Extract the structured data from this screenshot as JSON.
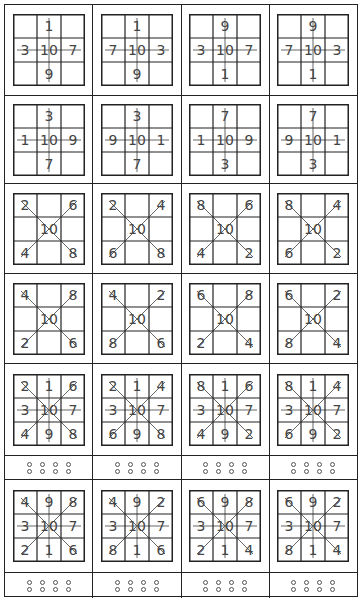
{
  "puzzle": {
    "description": "3x3 grids with center value 10 and numbers placed around it, connected by lines through the center",
    "center": "10",
    "rows": [
      {
        "type": "grid",
        "cells": [
          {
            "lines": [
              "v",
              "h"
            ],
            "g": [
              "",
              "1",
              "",
              "3",
              "10",
              "7",
              "",
              "9",
              ""
            ]
          },
          {
            "lines": [
              "v",
              "h"
            ],
            "g": [
              "",
              "1",
              "",
              "7",
              "10",
              "3",
              "",
              "9",
              ""
            ]
          },
          {
            "lines": [
              "v",
              "h"
            ],
            "g": [
              "",
              "9",
              "",
              "3",
              "10",
              "7",
              "",
              "1",
              ""
            ]
          },
          {
            "lines": [
              "v",
              "h"
            ],
            "g": [
              "",
              "9",
              "",
              "7",
              "10",
              "3",
              "",
              "1",
              ""
            ]
          }
        ]
      },
      {
        "type": "grid",
        "cells": [
          {
            "lines": [
              "v",
              "h"
            ],
            "g": [
              "",
              "3",
              "",
              "1",
              "10",
              "9",
              "",
              "7",
              ""
            ]
          },
          {
            "lines": [
              "v",
              "h"
            ],
            "g": [
              "",
              "3",
              "",
              "9",
              "10",
              "1",
              "",
              "7",
              ""
            ]
          },
          {
            "lines": [
              "v",
              "h"
            ],
            "g": [
              "",
              "7",
              "",
              "1",
              "10",
              "9",
              "",
              "3",
              ""
            ]
          },
          {
            "lines": [
              "v",
              "h"
            ],
            "g": [
              "",
              "7",
              "",
              "9",
              "10",
              "1",
              "",
              "3",
              ""
            ]
          }
        ]
      },
      {
        "type": "grid",
        "cells": [
          {
            "lines": [
              "d1",
              "d2"
            ],
            "g": [
              "2",
              "",
              "6",
              "",
              "10",
              "",
              "4",
              "",
              "8"
            ]
          },
          {
            "lines": [
              "d1",
              "d2"
            ],
            "g": [
              "2",
              "",
              "4",
              "",
              "10",
              "",
              "6",
              "",
              "8"
            ]
          },
          {
            "lines": [
              "d1",
              "d2"
            ],
            "g": [
              "8",
              "",
              "6",
              "",
              "10",
              "",
              "4",
              "",
              "2"
            ]
          },
          {
            "lines": [
              "d1",
              "d2"
            ],
            "g": [
              "8",
              "",
              "4",
              "",
              "10",
              "",
              "6",
              "",
              "2"
            ]
          }
        ]
      },
      {
        "type": "grid",
        "cells": [
          {
            "lines": [
              "d1",
              "d2"
            ],
            "g": [
              "4",
              "",
              "8",
              "",
              "10",
              "",
              "2",
              "",
              "6"
            ]
          },
          {
            "lines": [
              "d1",
              "d2"
            ],
            "g": [
              "4",
              "",
              "2",
              "",
              "10",
              "",
              "8",
              "",
              "6"
            ]
          },
          {
            "lines": [
              "d1",
              "d2"
            ],
            "g": [
              "6",
              "",
              "8",
              "",
              "10",
              "",
              "2",
              "",
              "4"
            ]
          },
          {
            "lines": [
              "d1",
              "d2"
            ],
            "g": [
              "6",
              "",
              "2",
              "",
              "10",
              "",
              "8",
              "",
              "4"
            ]
          }
        ]
      },
      {
        "type": "grid",
        "cells": [
          {
            "lines": [
              "v",
              "h",
              "d1",
              "d2"
            ],
            "g": [
              "2",
              "1",
              "6",
              "3",
              "10",
              "7",
              "4",
              "9",
              "8"
            ]
          },
          {
            "lines": [
              "v",
              "h",
              "d1",
              "d2"
            ],
            "g": [
              "2",
              "1",
              "4",
              "3",
              "10",
              "7",
              "6",
              "9",
              "8"
            ]
          },
          {
            "lines": [
              "v",
              "h",
              "d1",
              "d2"
            ],
            "g": [
              "8",
              "1",
              "6",
              "3",
              "10",
              "7",
              "4",
              "9",
              "2"
            ]
          },
          {
            "lines": [
              "v",
              "h",
              "d1",
              "d2"
            ],
            "g": [
              "8",
              "1",
              "4",
              "3",
              "10",
              "7",
              "6",
              "9",
              "2"
            ]
          }
        ]
      },
      {
        "type": "dots",
        "cells": [
          {
            "rows": 2,
            "cols": 4
          },
          {
            "rows": 2,
            "cols": 4
          },
          {
            "rows": 2,
            "cols": 4
          },
          {
            "rows": 2,
            "cols": 4
          }
        ]
      },
      {
        "type": "grid",
        "cells": [
          {
            "lines": [
              "v",
              "h",
              "d1",
              "d2"
            ],
            "g": [
              "4",
              "9",
              "8",
              "3",
              "10",
              "7",
              "2",
              "1",
              "6"
            ]
          },
          {
            "lines": [
              "v",
              "h",
              "d1",
              "d2"
            ],
            "g": [
              "4",
              "9",
              "2",
              "3",
              "10",
              "7",
              "8",
              "1",
              "6"
            ]
          },
          {
            "lines": [
              "v",
              "h",
              "d1",
              "d2"
            ],
            "g": [
              "6",
              "9",
              "8",
              "3",
              "10",
              "7",
              "2",
              "1",
              "4"
            ]
          },
          {
            "lines": [
              "v",
              "h",
              "d1",
              "d2"
            ],
            "g": [
              "6",
              "9",
              "2",
              "3",
              "10",
              "7",
              "8",
              "1",
              "4"
            ]
          }
        ]
      },
      {
        "type": "dots",
        "cells": [
          {
            "rows": 2,
            "cols": 4
          },
          {
            "rows": 2,
            "cols": 4
          },
          {
            "rows": 2,
            "cols": 4
          },
          {
            "rows": 2,
            "cols": 4
          }
        ]
      }
    ],
    "row_heights": [
      91,
      88,
      90,
      90,
      92,
      24,
      93,
      25
    ],
    "colors": {
      "line": "#222222",
      "connector": "#666666",
      "text": "#444444",
      "dot": "#555555"
    }
  }
}
